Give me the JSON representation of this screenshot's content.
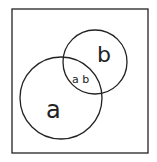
{
  "diagram": {
    "type": "venn",
    "universe": {
      "x": 12,
      "y": 9,
      "width": 136,
      "height": 144
    },
    "sets": [
      {
        "name": "a",
        "label": "a",
        "cx": 61,
        "cy": 98,
        "r": 41
      },
      {
        "name": "b",
        "label": "b",
        "cx": 95,
        "cy": 62,
        "r": 32
      }
    ],
    "intersection": {
      "label": "a b"
    },
    "stroke_color": "#222222"
  }
}
